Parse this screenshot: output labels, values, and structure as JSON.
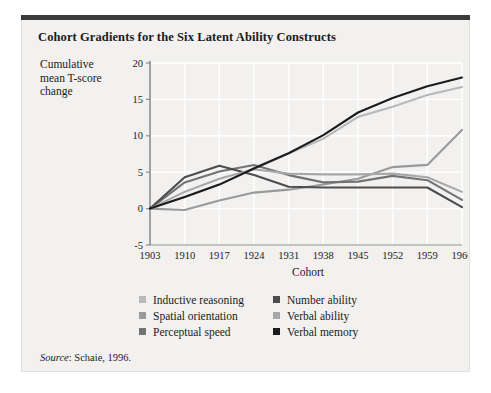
{
  "figure": {
    "title": "Cohort Gradients for the Six Latent Ability Constructs",
    "source_word": "Source",
    "source_rest": ": Schaie, 1996."
  },
  "axes": {
    "ylabel_line1": "Cumulative",
    "ylabel_line2": "mean T-score",
    "ylabel_line3": "change",
    "xlabel": "Cohort"
  },
  "chart_data": {
    "type": "line",
    "title": "Cohort Gradients for the Six Latent Ability Constructs",
    "xlabel": "Cohort",
    "ylabel": "Cumulative mean T-score change",
    "categories": [
      "1903",
      "1910",
      "1917",
      "1924",
      "1931",
      "1938",
      "1945",
      "1952",
      "1959",
      "1966"
    ],
    "x": [
      1903,
      1910,
      1917,
      1924,
      1931,
      1938,
      1945,
      1952,
      1959,
      1966
    ],
    "ylim": [
      -5,
      20
    ],
    "yticks": [
      -5,
      0,
      5,
      10,
      15,
      20
    ],
    "grid": true,
    "legend_position": "below",
    "series": [
      {
        "name": "Inductive reasoning",
        "color": "#b9b9b9",
        "values": [
          0,
          1.6,
          3.3,
          5.6,
          7.6,
          9.6,
          12.6,
          14.0,
          15.6,
          16.7
        ]
      },
      {
        "name": "Spatial orientation",
        "color": "#9a9a9a",
        "values": [
          0,
          -0.2,
          1.1,
          2.2,
          2.6,
          3.3,
          4.1,
          5.7,
          6.0,
          10.8
        ]
      },
      {
        "name": "Perceptual speed",
        "color": "#737373",
        "values": [
          0,
          3.6,
          5.1,
          6.0,
          4.6,
          3.6,
          3.7,
          4.5,
          3.9,
          1.2
        ]
      },
      {
        "name": "Number ability",
        "color": "#4d4d4d",
        "values": [
          0,
          4.3,
          5.9,
          4.6,
          3.0,
          2.9,
          2.9,
          2.9,
          2.9,
          0.2
        ]
      },
      {
        "name": "Verbal ability",
        "color": "#a8a8a8",
        "values": [
          0,
          2.3,
          4.1,
          5.4,
          4.8,
          4.7,
          4.7,
          4.8,
          4.3,
          2.3
        ]
      },
      {
        "name": "Verbal memory",
        "color": "#1c1c1c",
        "values": [
          0,
          1.6,
          3.3,
          5.5,
          7.6,
          10.1,
          13.2,
          15.2,
          16.8,
          18.0
        ]
      }
    ]
  },
  "legend": {
    "left": [
      {
        "label": "Inductive reasoning",
        "color": "#b9b9b9"
      },
      {
        "label": "Spatial orientation",
        "color": "#9a9a9a"
      },
      {
        "label": "Perceptual speed",
        "color": "#737373"
      }
    ],
    "right": [
      {
        "label": "Number ability",
        "color": "#4d4d4d"
      },
      {
        "label": "Verbal ability",
        "color": "#a8a8a8"
      },
      {
        "label": "Verbal memory",
        "color": "#1c1c1c"
      }
    ]
  }
}
